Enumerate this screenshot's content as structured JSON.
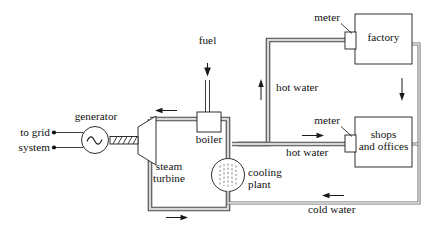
{
  "diagram": {
    "type": "process-flow-diagram",
    "labels": {
      "to_grid": "to grid",
      "system": "system",
      "generator": "generator",
      "steam_turbine_line1": "steam",
      "steam_turbine_line2": "turbine",
      "fuel": "fuel",
      "boiler": "boiler",
      "cooling_plant_line1": "cooling",
      "cooling_plant_line2": "plant",
      "hot_water_upper": "hot water",
      "hot_water_lower": "hot water",
      "cold_water": "cold water",
      "meter_factory": "meter",
      "meter_shops": "meter",
      "factory": "factory",
      "shops_line1": "shops",
      "shops_line2": "and offices"
    },
    "components": [
      {
        "name": "generator",
        "shape": "circle-with-sine",
        "label": "generator"
      },
      {
        "name": "steam-turbine",
        "shape": "trapezoid",
        "label": "steam turbine"
      },
      {
        "name": "boiler",
        "shape": "rectangle",
        "label": "boiler"
      },
      {
        "name": "cooling-plant",
        "shape": "circle-dashed-fill",
        "label": "cooling plant"
      },
      {
        "name": "factory",
        "shape": "rectangle",
        "label": "factory"
      },
      {
        "name": "shops-and-offices",
        "shape": "rectangle",
        "label": "shops and offices"
      },
      {
        "name": "meter-factory",
        "shape": "small-rectangle",
        "label": "meter"
      },
      {
        "name": "meter-shops",
        "shape": "small-rectangle",
        "label": "meter"
      }
    ],
    "flows": [
      {
        "name": "fuel-input",
        "label": "fuel",
        "direction": "down"
      },
      {
        "name": "steam-loop-top",
        "label": "",
        "direction": "left"
      },
      {
        "name": "steam-loop-bottom",
        "label": "",
        "direction": "right"
      },
      {
        "name": "hot-water-riser",
        "label": "hot water",
        "direction": "up"
      },
      {
        "name": "hot-water-to-factory",
        "label": "",
        "direction": "right"
      },
      {
        "name": "hot-water-to-shops",
        "label": "hot water",
        "direction": "right"
      },
      {
        "name": "return-down",
        "label": "",
        "direction": "down"
      },
      {
        "name": "cold-water-return",
        "label": "cold water",
        "direction": "left"
      }
    ],
    "colors": {
      "pipe_stroke": "#4a4a4a",
      "pipe_fill": "#d8d8d8",
      "outline": "#1a1a1a",
      "background": "#ffffff"
    }
  }
}
